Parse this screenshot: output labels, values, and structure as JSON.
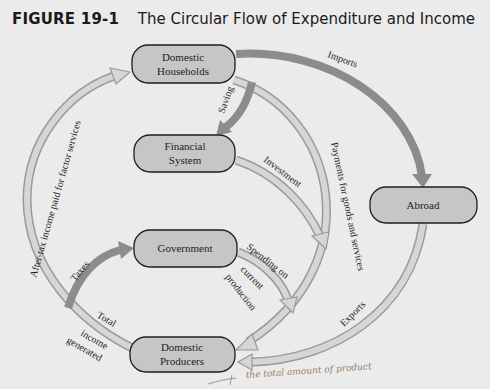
{
  "figure": {
    "number": "FIGURE 19-1",
    "title": "The Circular Flow of Expenditure and Income"
  },
  "nodes": {
    "households": {
      "line1": "Domestic",
      "line2": "Households"
    },
    "financial": {
      "line1": "Financial",
      "line2": "System"
    },
    "government": {
      "line1": "Government"
    },
    "producers": {
      "line1": "Domestic",
      "line2": "Producers"
    },
    "abroad": {
      "line1": "Abroad"
    }
  },
  "flows": {
    "imports": "Imports",
    "saving": "Saving",
    "investment": "Investment",
    "payments": "Payments for goods and services",
    "spending_line1": "Spending on",
    "spending_line2": "current",
    "spending_line3": "production",
    "exports": "Exports",
    "after_tax": "After-tax income paid for factor services",
    "taxes": "Taxes",
    "total_line1": "Total",
    "total_line2": "income",
    "total_line3": "generated"
  },
  "annotation": {
    "handwritten_note": "the total amount of product"
  },
  "colors": {
    "background": "#ebebeb",
    "node_fill": "#c6c6c6",
    "dark_arrow": "#8c8c8c",
    "light_arrow": "#d6d6d6",
    "light_arrow_outline": "#9a9a9a"
  }
}
